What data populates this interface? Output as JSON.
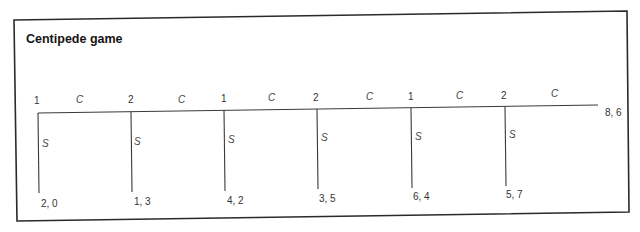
{
  "title": "Centipede game",
  "colors": {
    "ink": "#2a2a2a",
    "background": "#ffffff"
  },
  "nodes": [
    {
      "player": "1",
      "continue": "C",
      "stop": "S",
      "stop_payoff": "2, 0"
    },
    {
      "player": "2",
      "continue": "C",
      "stop": "S",
      "stop_payoff": "1, 3"
    },
    {
      "player": "1",
      "continue": "C",
      "stop": "S",
      "stop_payoff": "4, 2"
    },
    {
      "player": "2",
      "continue": "C",
      "stop": "S",
      "stop_payoff": "3, 5"
    },
    {
      "player": "1",
      "continue": "C",
      "stop": "S",
      "stop_payoff": "6, 4"
    },
    {
      "player": "2",
      "continue": "C",
      "stop": "S",
      "stop_payoff": "5, 7"
    }
  ],
  "terminal_payoff": "8, 6"
}
